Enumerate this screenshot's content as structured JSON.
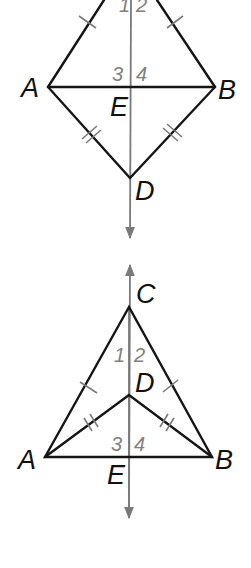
{
  "figures": [
    {
      "id": "kite",
      "points": {
        "C_top_left": [
          103,
          0
        ],
        "C_top_right": [
          158,
          0
        ],
        "A": [
          48,
          87
        ],
        "B": [
          215,
          87
        ],
        "D": [
          130,
          178
        ],
        "E": [
          132,
          87
        ]
      },
      "labels": {
        "A": "A",
        "B": "B",
        "D": "D",
        "E": "E"
      },
      "angles": {
        "a1": "1",
        "a2": "2",
        "a3": "3",
        "a4": "4"
      }
    },
    {
      "id": "dart",
      "points": {
        "C": [
          129,
          307
        ],
        "A": [
          45,
          457
        ],
        "B": [
          212,
          457
        ],
        "D": [
          129,
          395
        ],
        "E": [
          129,
          457
        ]
      },
      "labels": {
        "C": "C",
        "A": "A",
        "B": "B",
        "D": "D",
        "E": "E"
      },
      "angles": {
        "a1": "1",
        "a2": "2",
        "a3": "3",
        "a4": "4"
      }
    }
  ],
  "colors": {
    "segment": "#151515",
    "axis": "#7a7a7a",
    "angle_label": "#808080"
  }
}
